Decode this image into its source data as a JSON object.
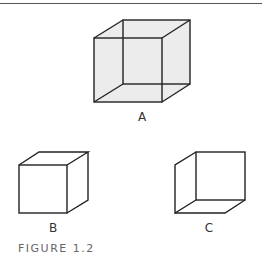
{
  "figure": {
    "caption": "FIGURE 1.2",
    "cubes": [
      {
        "label": "A",
        "description": "Necker cube with transparent faces (all edges visible)"
      },
      {
        "label": "B",
        "description": "Opaque cube viewed from above (front face lower-left)"
      },
      {
        "label": "C",
        "description": "Opaque cube viewed from below (front face upper-right)"
      }
    ],
    "colors": {
      "line": "#222222",
      "fill": "#ececec",
      "rule": "#555555"
    }
  }
}
